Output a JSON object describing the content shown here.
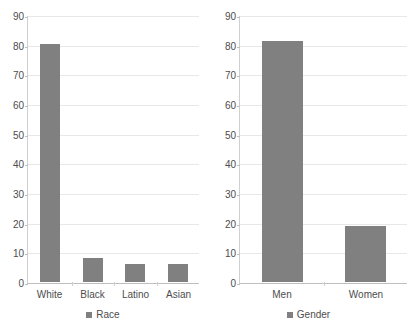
{
  "colors": {
    "bar": "#808080",
    "gridline": "#e8e8e8",
    "axis": "#bfbfbf",
    "tick_text": "#4d4d4d"
  },
  "charts": [
    {
      "id": "race-chart",
      "title": "",
      "legend_label": "Race",
      "y_ticks": [
        "90",
        "80",
        "70",
        "60",
        "50",
        "40",
        "30",
        "20",
        "10",
        "0"
      ],
      "chart_data": {
        "type": "bar",
        "title": "",
        "xlabel": "Race",
        "ylabel": "",
        "ylim": [
          0,
          90
        ],
        "ytick_step": 10,
        "grid": true,
        "legend": [
          "Race"
        ],
        "legend_position": "bottom",
        "categories": [
          "White",
          "Black",
          "Latino",
          "Asian"
        ],
        "values": [
          80.5,
          8,
          6,
          6
        ]
      }
    },
    {
      "id": "gender-chart",
      "title": "",
      "legend_label": "Gender",
      "y_ticks": [
        "90",
        "80",
        "70",
        "60",
        "50",
        "40",
        "30",
        "20",
        "10",
        "0"
      ],
      "chart_data": {
        "type": "bar",
        "title": "",
        "xlabel": "Gender",
        "ylabel": "",
        "ylim": [
          0,
          90
        ],
        "ytick_step": 10,
        "grid": true,
        "legend": [
          "Gender"
        ],
        "legend_position": "bottom",
        "categories": [
          "Men",
          "Women"
        ],
        "values": [
          81.5,
          19
        ]
      }
    }
  ]
}
